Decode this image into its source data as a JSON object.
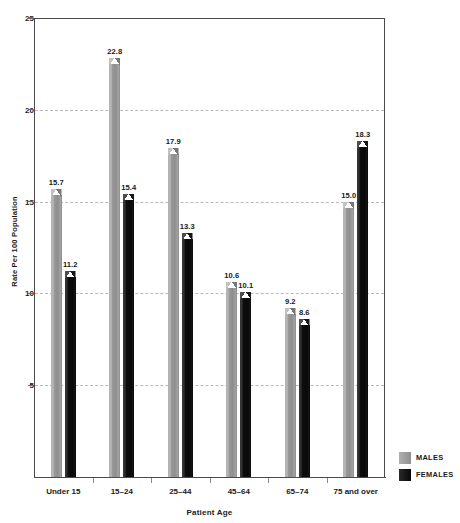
{
  "chart_data": {
    "type": "bar",
    "title": "",
    "xlabel": "Patient Age",
    "ylabel": "Rate Per 100 Population",
    "categories": [
      "Under 15",
      "15–24",
      "25–44",
      "45–64",
      "65–74",
      "75 and over"
    ],
    "series": [
      {
        "name": "MALES",
        "color": "#969696",
        "values": [
          15.7,
          22.8,
          17.9,
          10.6,
          9.2,
          15.0
        ]
      },
      {
        "name": "FEMALES",
        "color": "#0a0a0a",
        "values": [
          11.2,
          15.4,
          13.3,
          10.1,
          8.6,
          18.3
        ]
      }
    ],
    "value_labels": {
      "MALES": [
        "15.7",
        "22.8",
        "17.9",
        "10.6",
        "9.2",
        "15.0"
      ],
      "FEMALES": [
        "11.2",
        "15.4",
        "13.3",
        "10.1",
        "8.6",
        "18.3"
      ]
    },
    "ylim": [
      0,
      25
    ],
    "yticks": [
      0,
      5,
      10,
      15,
      20,
      25
    ],
    "ytick_labels": [
      "",
      "5",
      "10",
      "15",
      "20",
      "25"
    ],
    "grid": "horizontal-dashed",
    "gridlines_at": [
      5,
      10,
      15,
      20
    ],
    "legend_position": "bottom-right",
    "legend": [
      "MALES",
      "FEMALES"
    ]
  }
}
